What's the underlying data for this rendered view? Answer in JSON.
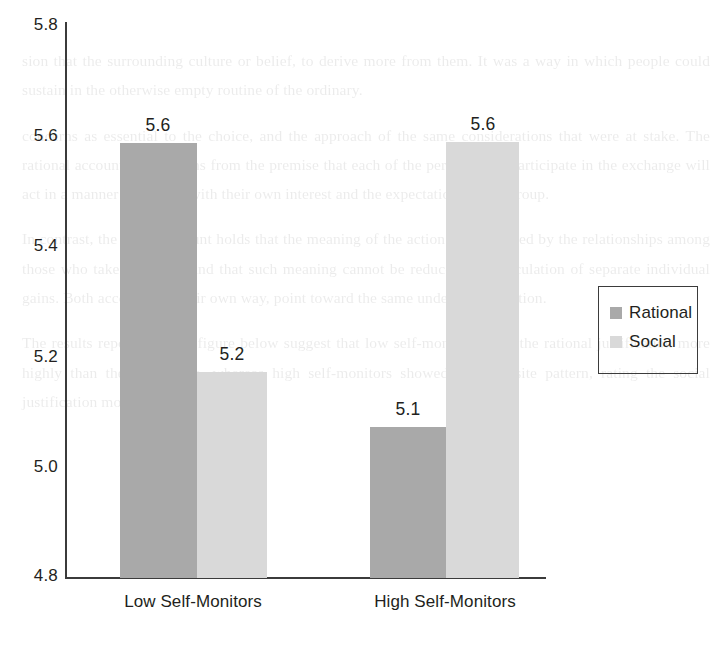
{
  "chart_data": {
    "type": "bar",
    "title": "",
    "subtitle": "",
    "xlabel": "",
    "ylabel": "",
    "categories": [
      "Low Self-Monitors",
      "High Self-Monitors"
    ],
    "series": [
      {
        "name": "Rational",
        "color": "#a9a9a9",
        "values": [
          5.6,
          5.1
        ]
      },
      {
        "name": "Social",
        "color": "#d9d9d9",
        "values": [
          5.2,
          5.6
        ]
      }
    ],
    "data_labels": [
      "5.6",
      "5.2",
      "5.1",
      "5.6"
    ],
    "ylim": [
      4.8,
      5.8
    ],
    "yticks": [
      "5.8",
      "5.6",
      "5.4",
      "5.2",
      "5.0",
      "4.8"
    ],
    "ytick_values": [
      5.8,
      5.6,
      5.4,
      5.2,
      5.0,
      4.8
    ],
    "grid": false,
    "legend_position": "right",
    "legend_entries": [
      "Rational",
      "Social"
    ],
    "axis_color": "#3b3b3b",
    "background": "#ffffff"
  },
  "legend": {
    "items": [
      {
        "label": "Rational",
        "swatch": "rational"
      },
      {
        "label": "Social",
        "swatch": "social"
      }
    ]
  },
  "page_bleed": {
    "lines": [
      "sion that the surrounding culture or belief, to derive more",
      "from them. It was a way in which people could sustain in the",
      "otherwise empty routine of the ordinary.",
      "concerns as essential to the choice, and the approach of the",
      "same considerations that were at stake. The rational account",
      "often begins from the premise that each of the persons who",
      "participate in the exchange will act in a manner consistent",
      "with their own interest and the expectations of the group.",
      "In contrast, the social account holds that the meaning of the",
      "action is constituted by the relationships among those who",
      "take part in it, and that such meaning cannot be reduced to",
      "a calculation of separate individual gains. Both accounts, in",
      "their own way, point toward the same underlying question.",
      "The results reported in the figure below suggest that low",
      "self-monitors rated the rational justification more highly",
      "than the social one, whereas high self-monitors showed the",
      "opposite pattern, rating the social justification more highly."
    ]
  }
}
